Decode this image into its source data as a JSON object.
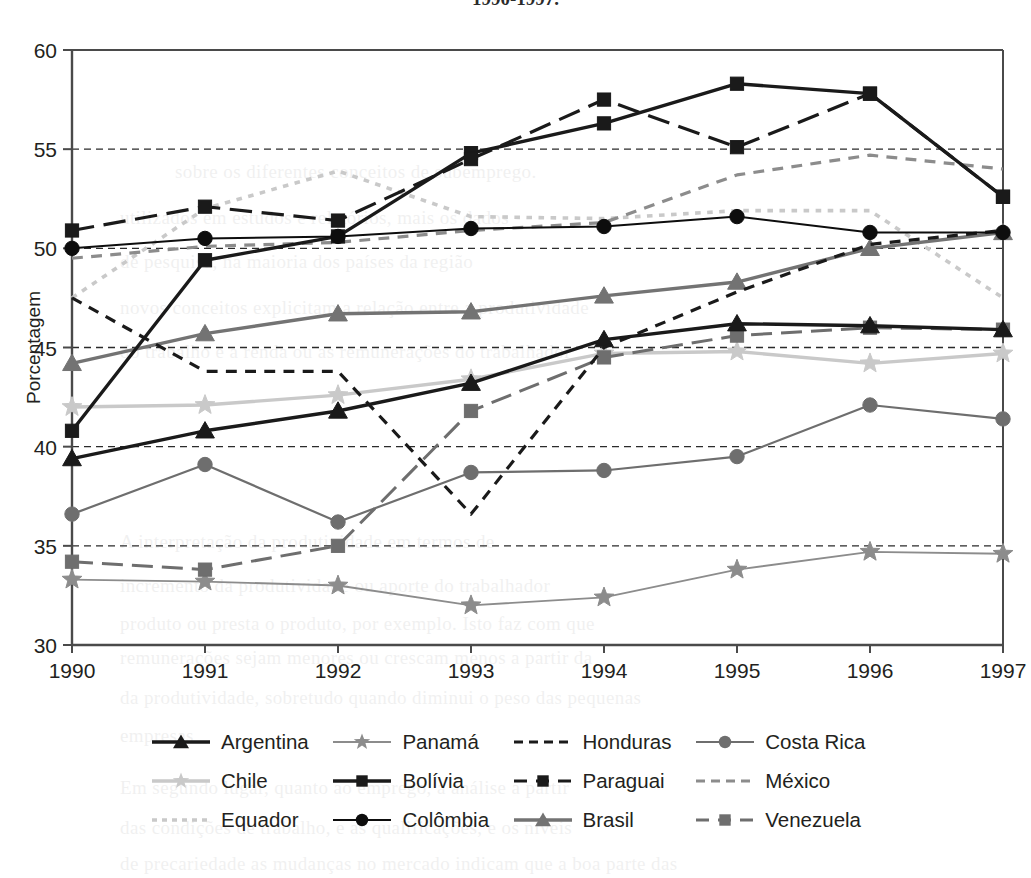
{
  "title": "1990-1997.",
  "axes": {
    "ylabel": "Porcentagem",
    "ytick_labels": [
      "60",
      "55",
      "50",
      "45",
      "40",
      "35",
      "30"
    ],
    "xtick_labels": [
      "1990",
      "1991",
      "1992",
      "1993",
      "1994",
      "1995",
      "1996",
      "1997"
    ]
  },
  "legend": [
    {
      "label": "Argentina",
      "color": "#1a1a1a",
      "marker": "triangle",
      "dash": "none",
      "width": 3.4,
      "key": "legend-key-argentina"
    },
    {
      "label": "Chile",
      "color": "#c9c9c9",
      "marker": "star",
      "dash": "none",
      "width": 3.4,
      "key": "legend-key-chile"
    },
    {
      "label": "Equador",
      "color": "#c9c9c9",
      "marker": "none",
      "dash": "dot",
      "width": 3.6,
      "key": "legend-key-equador"
    },
    {
      "label": "Panamá",
      "color": "#8c8c8c",
      "marker": "star",
      "dash": "none",
      "width": 1.8,
      "key": "legend-key-panama"
    },
    {
      "label": "Bolívia",
      "color": "#1a1a1a",
      "marker": "square",
      "dash": "none",
      "width": 3.4,
      "key": "legend-key-bolivia"
    },
    {
      "label": "Colômbia",
      "color": "#0d0d0d",
      "marker": "circle",
      "dash": "none",
      "width": 2.0,
      "key": "legend-key-colombia"
    },
    {
      "label": "Honduras",
      "color": "#1a1a1a",
      "marker": "none",
      "dash": "dash",
      "width": 3.2,
      "key": "legend-key-honduras"
    },
    {
      "label": "Paraguai",
      "color": "#1a1a1a",
      "marker": "square",
      "dash": "long",
      "width": 3.2,
      "key": "legend-key-paraguai"
    },
    {
      "label": "Brasil",
      "color": "#737373",
      "marker": "triangle",
      "dash": "none",
      "width": 3.4,
      "key": "legend-key-brasil"
    },
    {
      "label": "Costa Rica",
      "color": "#6e6e6e",
      "marker": "circle",
      "dash": "none",
      "width": 2.2,
      "key": "legend-key-costa-rica"
    },
    {
      "label": "México",
      "color": "#8c8c8c",
      "marker": "none",
      "dash": "dash",
      "width": 3.2,
      "key": "legend-key-mexico"
    },
    {
      "label": "Venezuela",
      "color": "#6e6e6e",
      "marker": "square",
      "dash": "long",
      "width": 3.0,
      "key": "legend-key-venezuela"
    }
  ],
  "chart_data": {
    "type": "line",
    "title": "1990-1997.",
    "xlabel": "",
    "ylabel": "Porcentagem",
    "x": [
      1990,
      1991,
      1992,
      1993,
      1994,
      1995,
      1996,
      1997
    ],
    "categories": [
      "1990",
      "1991",
      "1992",
      "1993",
      "1994",
      "1995",
      "1996",
      "1997"
    ],
    "ylim": [
      30,
      60
    ],
    "ytick_values": [
      30,
      35,
      40,
      45,
      50,
      55,
      60
    ],
    "grid": "horizontal-dashed",
    "legend_position": "bottom",
    "series": [
      {
        "name": "Argentina",
        "color": "#1a1a1a",
        "marker": "triangle",
        "dash": "none",
        "width": 3.4,
        "values": [
          39.4,
          40.8,
          41.8,
          43.2,
          45.4,
          46.2,
          46.1,
          45.9
        ]
      },
      {
        "name": "Bolívia",
        "color": "#1a1a1a",
        "marker": "square",
        "dash": "none",
        "width": 3.4,
        "values": [
          40.8,
          49.4,
          50.6,
          54.8,
          56.3,
          58.3,
          57.8,
          52.6
        ]
      },
      {
        "name": "Brasil",
        "color": "#737373",
        "marker": "triangle",
        "dash": "none",
        "width": 3.4,
        "values": [
          44.2,
          45.7,
          46.7,
          46.8,
          47.6,
          48.3,
          50.0,
          50.8
        ]
      },
      {
        "name": "Chile",
        "color": "#c9c9c9",
        "marker": "star",
        "dash": "none",
        "width": 3.4,
        "values": [
          42.0,
          42.1,
          42.6,
          43.4,
          44.7,
          44.8,
          44.2,
          44.7
        ]
      },
      {
        "name": "Colômbia",
        "color": "#0d0d0d",
        "marker": "circle",
        "dash": "none",
        "width": 2.0,
        "values": [
          50.0,
          50.5,
          50.6,
          51.0,
          51.1,
          51.6,
          50.8,
          50.8
        ]
      },
      {
        "name": "Costa Rica",
        "color": "#6e6e6e",
        "marker": "circle",
        "dash": "none",
        "width": 2.2,
        "values": [
          36.6,
          39.1,
          36.2,
          38.7,
          38.8,
          39.5,
          42.1,
          41.4
        ]
      },
      {
        "name": "Equador",
        "color": "#c9c9c9",
        "marker": "none",
        "dash": "dot",
        "width": 3.6,
        "values": [
          47.5,
          52.0,
          53.9,
          51.6,
          51.5,
          51.9,
          51.9,
          47.5
        ]
      },
      {
        "name": "Honduras",
        "color": "#1a1a1a",
        "marker": "none",
        "dash": "dash",
        "width": 3.2,
        "values": [
          47.5,
          43.8,
          43.8,
          36.6,
          45.0,
          47.8,
          50.2,
          50.9
        ]
      },
      {
        "name": "México",
        "color": "#8c8c8c",
        "marker": "none",
        "dash": "dash",
        "width": 3.2,
        "values": [
          49.5,
          50.1,
          50.3,
          50.9,
          51.3,
          53.7,
          54.7,
          54.0
        ]
      },
      {
        "name": "Panamá",
        "color": "#8c8c8c",
        "marker": "star",
        "dash": "none",
        "width": 1.8,
        "values": [
          33.3,
          33.2,
          33.0,
          32.0,
          32.4,
          33.8,
          34.7,
          34.6
        ]
      },
      {
        "name": "Paraguai",
        "color": "#1a1a1a",
        "marker": "square",
        "dash": "long",
        "width": 3.2,
        "values": [
          50.9,
          52.1,
          51.4,
          54.5,
          57.5,
          55.1,
          57.8,
          52.6
        ]
      },
      {
        "name": "Venezuela",
        "color": "#6e6e6e",
        "marker": "square",
        "dash": "long",
        "width": 3.0,
        "values": [
          34.2,
          33.8,
          35.0,
          41.8,
          44.5,
          45.6,
          46.0,
          45.9
        ]
      }
    ]
  },
  "bleed_text": [
    {
      "x": 175,
      "y": 150,
      "t": "sobre os diferentes conceitos de subemprego."
    },
    {
      "x": 120,
      "y": 196,
      "t": "utilizados em estudos e relatórios, mais os dados"
    },
    {
      "x": 120,
      "y": 240,
      "t": "de pesquisa, na maioria dos países da região"
    },
    {
      "x": 120,
      "y": 286,
      "t": "novos conceitos explicitam a relação entre a produtividade"
    },
    {
      "x": 120,
      "y": 330,
      "t": "do trabalho e a renda ou as remunerações do trabalhador"
    },
    {
      "x": 120,
      "y": 520,
      "t": "A interpretação da produtividade em termos de"
    },
    {
      "x": 120,
      "y": 564,
      "t": "incremento da produtividade ou aporte do trabalhador"
    },
    {
      "x": 120,
      "y": 602,
      "t": "produto ou presta o produto, por exemplo. Isto faz com que"
    },
    {
      "x": 120,
      "y": 636,
      "t": "remunerações sejam menores ou crescam menos a partir da"
    },
    {
      "x": 120,
      "y": 676,
      "t": "da produtividade, sobretudo quando diminui o peso das pequenas"
    },
    {
      "x": 120,
      "y": 714,
      "t": "empresas"
    },
    {
      "x": 120,
      "y": 766,
      "t": "Em segundo lugar, quanto ao emprego, a análise a partir"
    },
    {
      "x": 120,
      "y": 806,
      "t": "das condições de trabalho, e as qualificações, e os níveis"
    },
    {
      "x": 120,
      "y": 842,
      "t": "de precariedade as mudanças no mercado indicam que a boa parte das"
    }
  ]
}
